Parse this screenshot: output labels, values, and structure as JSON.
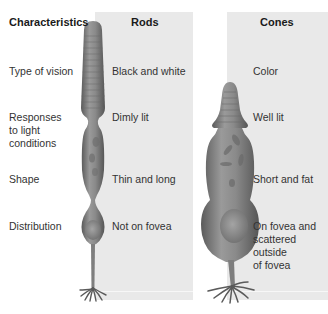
{
  "headers": {
    "characteristics": "Characteristics",
    "rods": "Rods",
    "cones": "Cones"
  },
  "rows": [
    {
      "label": [
        "Type of vision"
      ],
      "rods": [
        "Black and white"
      ],
      "cones": [
        "Color"
      ]
    },
    {
      "label": [
        "Responses",
        "to light",
        "conditions"
      ],
      "rods": [
        "Dimly lit"
      ],
      "cones": [
        "Well lit"
      ]
    },
    {
      "label": [
        "Shape"
      ],
      "rods": [
        "Thin and long"
      ],
      "cones": [
        "Short and fat"
      ]
    },
    {
      "label": [
        "Distribution"
      ],
      "rods": [
        "Not on fovea"
      ],
      "cones": [
        "On fovea and",
        "scattered",
        "outside",
        "of fovea"
      ]
    }
  ],
  "colors": {
    "panel_bg": "#e9e9e9",
    "cell_fill": "#8c8c8c",
    "cell_dark": "#5e5e5e",
    "text": "#333333"
  },
  "illustrations": {
    "rod": "rod-cell-illustration",
    "cone": "cone-cell-illustration"
  }
}
